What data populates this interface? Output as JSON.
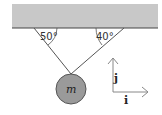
{
  "diagram": {
    "type": "physics-free-body",
    "ceiling": {
      "color": "#c8c8c8",
      "edge_color": "#444444"
    },
    "strings": [
      {
        "name": "left-string",
        "angle_label": "50°"
      },
      {
        "name": "right-string",
        "angle_label": "40°"
      }
    ],
    "mass": {
      "label": "m",
      "fill": "#9a9a9a"
    },
    "axes": {
      "x_label": "i",
      "y_label": "j"
    }
  }
}
